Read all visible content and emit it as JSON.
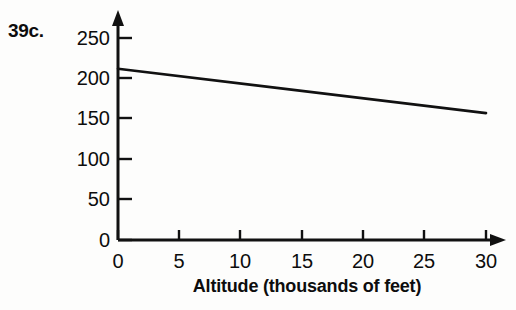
{
  "figure": {
    "problem_label": "39c.",
    "background_color": "#fdfdfc",
    "ink_color": "#111111"
  },
  "chart_data": {
    "type": "line",
    "title": "",
    "subtitle": "",
    "xlabel": "Altitude (thousands of feet)",
    "ylabel": "",
    "xlim": [
      0,
      30
    ],
    "ylim": [
      0,
      250
    ],
    "xticks": [
      0,
      5,
      10,
      15,
      20,
      25,
      30
    ],
    "xtick_labels": [
      "0",
      "5",
      "10",
      "15",
      "20",
      "25",
      "30"
    ],
    "yticks": [
      0,
      50,
      100,
      150,
      200,
      250
    ],
    "ytick_labels": [
      "0",
      "50",
      "100",
      "150",
      "200",
      "250"
    ],
    "grid": false,
    "legend": false,
    "legend_position": "none",
    "axis_arrows": true,
    "tick_direction": "in",
    "annotations": [],
    "series": [
      {
        "name": "boiling point vs altitude",
        "x": [
          0,
          30
        ],
        "values": [
          212,
          157
        ],
        "line_color": "#111111",
        "line_width": 2.6,
        "markers": false
      }
    ]
  }
}
